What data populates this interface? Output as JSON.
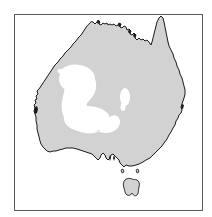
{
  "figure": {
    "type": "distribution-map",
    "region": "Australia",
    "width": 212,
    "height": 217,
    "background_color": "#ffffff",
    "frame": {
      "x": 14,
      "y": 14,
      "width": 189,
      "height": 197,
      "border_color": "#5a5a5a",
      "border_width": 1.5,
      "fill_color": "#ffffff"
    },
    "landmass": {
      "name": "Australian mainland",
      "fill_color": "#d2d2d2",
      "outline_color": "#1a1a1a",
      "outline_width": 1.0
    },
    "island": {
      "name": "Tasmania",
      "fill_color": "#d2d2d2",
      "outline_color": "#1a1a1a"
    },
    "gaps": [
      {
        "name": "central-west-gap",
        "label": "large interior absence patch",
        "fill_color": "#ffffff"
      },
      {
        "name": "central-east-gap",
        "label": "small interior absence patch",
        "fill_color": "#ffffff"
      }
    ],
    "features": [
      {
        "name": "cape-york-peninsula",
        "position": "north-east"
      },
      {
        "name": "gulf-of-carpentaria",
        "position": "north"
      },
      {
        "name": "arnhem-land",
        "position": "north"
      },
      {
        "name": "great-australian-bight",
        "position": "south"
      },
      {
        "name": "shark-bay-notch",
        "position": "west"
      },
      {
        "name": "spencer-gulf",
        "position": "south-central"
      },
      {
        "name": "bass-strait-islands",
        "position": "south-east"
      }
    ],
    "labels": [],
    "legend": null,
    "axis": null,
    "caption": null
  }
}
